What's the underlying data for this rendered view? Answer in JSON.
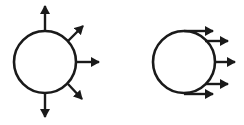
{
  "diagram": {
    "stroke_color": "#1a1a1a",
    "background": "#ffffff",
    "figures": [
      {
        "name": "radial-emission",
        "description": "Circle with arrows pointing radially outward in multiple directions",
        "circle": {
          "cx": 45,
          "cy": 62,
          "r": 31
        },
        "arrows": [
          {
            "direction": "up",
            "angle_deg": -90
          },
          {
            "direction": "up-right",
            "angle_deg": -40
          },
          {
            "direction": "right",
            "angle_deg": 0
          },
          {
            "direction": "down-right",
            "angle_deg": 40
          },
          {
            "direction": "down",
            "angle_deg": 90
          }
        ]
      },
      {
        "name": "directional-emission",
        "description": "Circle with parallel arrows all pointing right",
        "circle": {
          "cx": 184,
          "cy": 62,
          "r": 31
        },
        "arrows": [
          {
            "y": 31,
            "x_end": 213
          },
          {
            "y": 41,
            "x_end": 229
          },
          {
            "y": 62,
            "x_end": 236
          },
          {
            "y": 84,
            "x_end": 229
          },
          {
            "y": 94,
            "x_end": 213
          }
        ]
      }
    ]
  }
}
